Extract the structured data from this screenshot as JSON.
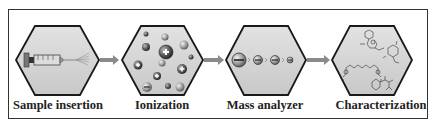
{
  "figure": {
    "steps": [
      {
        "label": "Sample insertion",
        "icon": "syringe-icon"
      },
      {
        "label": "Ionization",
        "icon": "ions-icon"
      },
      {
        "label": "Mass analyzer",
        "icon": "ion-separation-icon"
      },
      {
        "label": "Characterization",
        "icon": "molecular-structures-icon"
      }
    ],
    "colors": {
      "hex_fill": "#d4d4d4",
      "hex_stroke": "#1a1a1a",
      "arrow": "#8a8a8a",
      "frame": "#333333"
    }
  }
}
